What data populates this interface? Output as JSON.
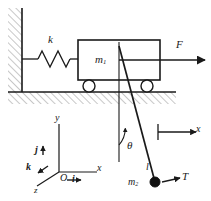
{
  "figure": {
    "type": "mechanics-free-body-diagram",
    "background_color": "#ffffff",
    "line_color": "#1a1a1a",
    "hatch_color": "#9a9a9a"
  },
  "labels": {
    "spring_constant": "k",
    "cart_mass": "m",
    "cart_mass_sub": "1",
    "applied_force": "F",
    "angle": "θ",
    "rod_length": "l",
    "bob_mass": "m",
    "bob_mass_sub": "2",
    "tension": "T",
    "axis_x_pendulum": "x",
    "axis_x_frame": "x",
    "axis_y_frame": "y",
    "axis_z_frame": "z",
    "origin": "O",
    "unit_vector_i": "i",
    "unit_vector_j": "j",
    "unit_vector_k": "k"
  },
  "geometry": {
    "wall_x": 22,
    "ground_y": 92,
    "cart": {
      "x": 78,
      "y": 40,
      "width": 82,
      "height": 40
    },
    "wheel_left": {
      "cx": 89,
      "cy": 86,
      "r": 6
    },
    "wheel_right": {
      "cx": 147,
      "cy": 86,
      "r": 6
    },
    "pivot": {
      "x": 119,
      "y": 60
    },
    "bob": {
      "cx": 155,
      "cy": 182,
      "r": 5
    },
    "angle_degrees": 12,
    "spring_coils": 4,
    "origin_point": {
      "x": 59,
      "y": 172
    }
  }
}
